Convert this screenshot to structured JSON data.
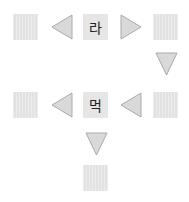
{
  "diagram": {
    "row1": {
      "center_label": "라",
      "arrows": [
        "left",
        "right"
      ]
    },
    "row2": {
      "center_label": "먹",
      "arrows": [
        "left",
        "left"
      ]
    },
    "connectors": [
      "down-right-column",
      "down-center-column"
    ],
    "colors": {
      "box": "#e2e2e2",
      "arrow_fill": "#d9d9d9",
      "arrow_stroke": "#aaaaaa"
    }
  }
}
